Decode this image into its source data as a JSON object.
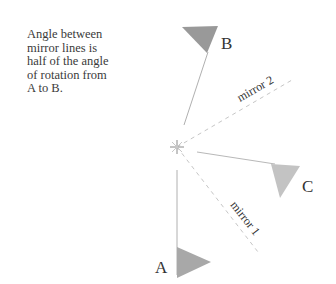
{
  "caption": {
    "lines": [
      "Angle between",
      "mirror lines is",
      "half of the angle",
      "of rotation from",
      "A to B."
    ]
  },
  "labels": {
    "a": "A",
    "b": "B",
    "c": "C",
    "mirror1": "mirror 1",
    "mirror2": "mirror 2"
  },
  "colors": {
    "triangle_a": "#a9a9a9",
    "triangle_b": "#9a9a9a",
    "triangle_c": "#c4c4c4",
    "line": "#9a9a9a",
    "dashed": "#bdbdbd",
    "text": "#333333"
  },
  "geometry": {
    "center": [
      177,
      147
    ],
    "rotation_line_a_end": [
      177,
      268
    ],
    "rotation_line_b_end": [
      208,
      52
    ],
    "rotation_line_c_end": [
      282,
      167
    ],
    "mirror1_end": [
      257,
      255
    ],
    "mirror2_end": [
      290,
      65
    ]
  }
}
